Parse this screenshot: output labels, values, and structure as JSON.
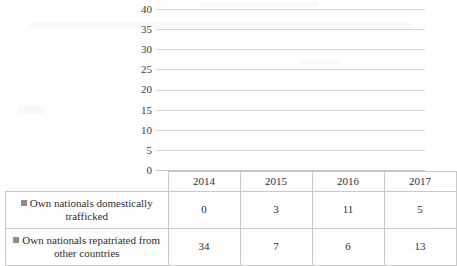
{
  "chart_data": {
    "type": "bar",
    "title": "",
    "xlabel": "",
    "ylabel": "",
    "categories": [
      "2014",
      "2015",
      "2016",
      "2017"
    ],
    "series": [
      {
        "name": "Own nationals domestically trafficked",
        "values": [
          0,
          3,
          11,
          5
        ],
        "color": "#8c8c8c"
      },
      {
        "name": "Own nationals repatriated from other countries",
        "values": [
          34,
          7,
          6,
          13
        ],
        "color": "#8c8c8c"
      }
    ],
    "ylim": [
      0,
      40
    ],
    "yticks": [
      "0",
      "5",
      "10",
      "15",
      "20",
      "25",
      "30",
      "35",
      "40"
    ],
    "grid": true,
    "legend_position": "data-table-left",
    "data_table_visible": true
  },
  "table": {
    "year_headers": [
      "2014",
      "2015",
      "2016",
      "2017"
    ],
    "rows": [
      {
        "label": "Own nationals domestically trafficked",
        "label_line1": "Own nationals domestically",
        "label_line2": "trafficked",
        "values": [
          "0",
          "3",
          "11",
          "5"
        ]
      },
      {
        "label": "Own nationals repatriated from other countries",
        "label_line1": "Own nationals repatriated",
        "label_line2": "from other countries",
        "values": [
          "34",
          "7",
          "6",
          "13"
        ]
      }
    ]
  },
  "artifacts": {
    "ghost_top": "",
    "ghost_mid": ""
  }
}
